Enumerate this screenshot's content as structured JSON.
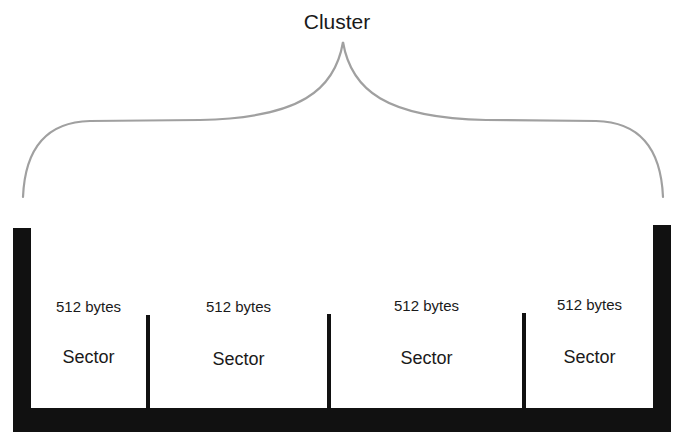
{
  "diagram": {
    "title": "Cluster",
    "colors": {
      "structure": "#111111",
      "brace": "#a0a0a0",
      "text": "#1a1a1a",
      "background": "#ffffff"
    },
    "sectors": [
      {
        "size": "512 bytes",
        "label": "Sector"
      },
      {
        "size": "512 bytes",
        "label": "Sector"
      },
      {
        "size": "512 bytes",
        "label": "Sector"
      },
      {
        "size": "512 bytes",
        "label": "Sector"
      }
    ]
  }
}
